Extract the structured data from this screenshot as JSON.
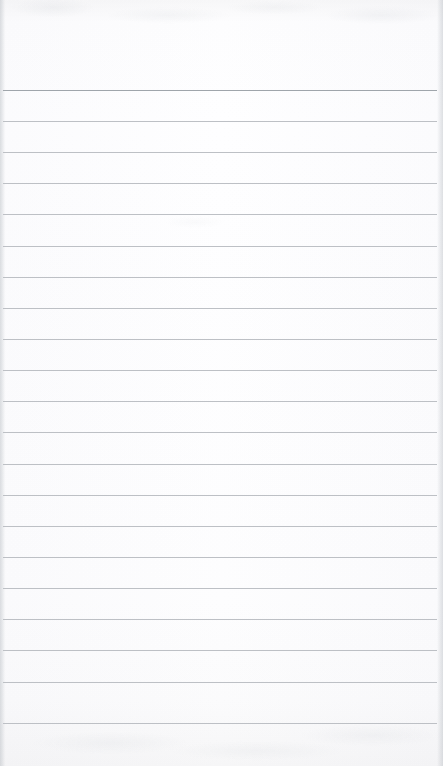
{
  "document": {
    "type": "ruled-notepad-page",
    "title": "",
    "body_text": "",
    "is_blank": true,
    "page_width_px": 443,
    "page_height_px": 766
  },
  "paper": {
    "background_color": "#fdfdfd",
    "surface_tint_color": "#f7f7f8",
    "edge_shadow_color": "#bcc0c6",
    "texture": "faint-scan-grain"
  },
  "ruling": {
    "line_color": "#b9bdc2",
    "first_line_color": "#9aa0a6",
    "line_thickness_px": 1,
    "line_spacing_px": 31.2,
    "line_count": 21,
    "first_line_y_px": 90,
    "last_line_y_px": 723,
    "line_start_x_px": 3,
    "line_end_x_px": 437,
    "margin_rule": "none",
    "line_positions_y_px": [
      90,
      121,
      152,
      183,
      214,
      246,
      277,
      308,
      339,
      370,
      401,
      432,
      464,
      495,
      526,
      557,
      588,
      619,
      650,
      682,
      723
    ]
  },
  "regions": {
    "header_label": "",
    "header_height_px": 90,
    "footer_label": "",
    "footer_height_px": 42
  },
  "rows": {
    "placeholder": "",
    "values": [
      "",
      "",
      "",
      "",
      "",
      "",
      "",
      "",
      "",
      "",
      "",
      "",
      "",
      "",
      "",
      "",
      "",
      "",
      "",
      ""
    ]
  }
}
